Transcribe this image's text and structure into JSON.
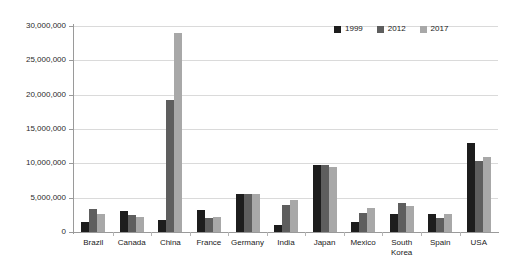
{
  "chart_data": {
    "type": "bar",
    "title": "",
    "subtitle": "",
    "xlabel": "",
    "ylabel": "",
    "ylim": [
      0,
      30000000
    ],
    "grid": true,
    "legend_position": "top-right",
    "categories": [
      "Brazil",
      "Canada",
      "China",
      "France",
      "Germany",
      "India",
      "Japan",
      "Mexico",
      "South\nKorea",
      "Spain",
      "USA"
    ],
    "ytick_labels": [
      "0",
      "5,000,000",
      "10,000,000",
      "15,000,000",
      "20,000,000",
      "25,000,000",
      "30,000,000"
    ],
    "ytick_values": [
      0,
      5000000,
      10000000,
      15000000,
      20000000,
      25000000,
      30000000
    ],
    "series": [
      {
        "name": "1999",
        "color": "#1d1d1d",
        "values": [
          1400000,
          3000000,
          1800000,
          3150000,
          5600000,
          1000000,
          9800000,
          1500000,
          2700000,
          2650000,
          13000000
        ]
      },
      {
        "name": "2012",
        "color": "#5e5e5e",
        "values": [
          3300000,
          2550000,
          19300000,
          2000000,
          5600000,
          3900000,
          9800000,
          2800000,
          4300000,
          2000000,
          10300000
        ]
      },
      {
        "name": "2017",
        "color": "#a8a8a8",
        "values": [
          2700000,
          2250000,
          29000000,
          2250000,
          5550000,
          4600000,
          9500000,
          3550000,
          3800000,
          2600000,
          11000000
        ]
      }
    ]
  }
}
